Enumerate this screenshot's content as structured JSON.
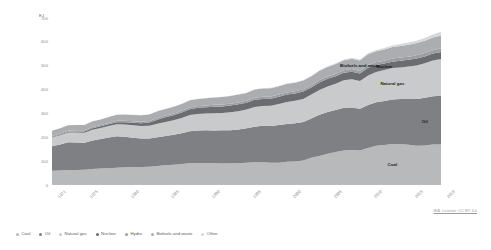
{
  "chart_data": {
    "type": "area",
    "title": "",
    "subtitle": "",
    "xlabel": "",
    "ylabel": "EJ",
    "unit": "EJ",
    "stacked": true,
    "grid": false,
    "legend_position": "bottom",
    "xlim": [
      1971,
      2019
    ],
    "ylim": [
      0,
      700
    ],
    "yticks": [
      0,
      100,
      200,
      300,
      400,
      500,
      600,
      700
    ],
    "ytick_labels": [
      "0",
      "100",
      "200",
      "300",
      "400",
      "500",
      "600",
      "700"
    ],
    "xticks": [
      1971,
      1975,
      1980,
      1985,
      1990,
      1995,
      2000,
      2005,
      2010,
      2015,
      2019
    ],
    "xtick_labels": [
      "1971",
      "1975",
      "1980",
      "1985",
      "1990",
      "1995",
      "2000",
      "2005",
      "2010",
      "2015",
      "2019"
    ],
    "x": [
      1971,
      1972,
      1973,
      1974,
      1975,
      1976,
      1977,
      1978,
      1979,
      1980,
      1981,
      1982,
      1983,
      1984,
      1985,
      1986,
      1987,
      1988,
      1989,
      1990,
      1991,
      1992,
      1993,
      1994,
      1995,
      1996,
      1997,
      1998,
      1999,
      2000,
      2001,
      2002,
      2003,
      2004,
      2005,
      2006,
      2007,
      2008,
      2009,
      2010,
      2011,
      2012,
      2013,
      2014,
      2015,
      2016,
      2017,
      2018,
      2019
    ],
    "series": [
      {
        "name": "Coal",
        "color": "#b8b9bb",
        "values": [
          60,
          61,
          63,
          63,
          64,
          67,
          69,
          70,
          72,
          74,
          74,
          75,
          77,
          80,
          83,
          85,
          88,
          91,
          92,
          92,
          91,
          90,
          91,
          91,
          93,
          95,
          95,
          93,
          93,
          97,
          99,
          103,
          114,
          122,
          131,
          138,
          145,
          147,
          145,
          155,
          165,
          168,
          172,
          172,
          169,
          165,
          166,
          170,
          170
        ]
      },
      {
        "name": "Oil",
        "color": "#7f8083",
        "values": [
          102,
          109,
          116,
          115,
          113,
          120,
          124,
          129,
          132,
          128,
          124,
          120,
          118,
          120,
          122,
          126,
          129,
          134,
          136,
          137,
          137,
          139,
          139,
          142,
          145,
          149,
          153,
          154,
          158,
          159,
          160,
          161,
          165,
          172,
          175,
          176,
          179,
          178,
          175,
          180,
          182,
          184,
          186,
          188,
          192,
          196,
          200,
          202,
          204
        ]
      },
      {
        "name": "Natural gas",
        "color": "#c9cacc",
        "values": [
          37,
          39,
          41,
          42,
          42,
          45,
          46,
          48,
          51,
          52,
          52,
          52,
          53,
          57,
          59,
          60,
          64,
          68,
          70,
          71,
          73,
          73,
          75,
          76,
          78,
          83,
          83,
          85,
          88,
          92,
          94,
          97,
          100,
          104,
          107,
          110,
          115,
          118,
          116,
          124,
          127,
          130,
          132,
          133,
          136,
          140,
          144,
          150,
          154
        ]
      },
      {
        "name": "Nuclear",
        "color": "#6b6c6f",
        "values": [
          2,
          3,
          3,
          4,
          5,
          6,
          7,
          8,
          8,
          9,
          11,
          12,
          14,
          17,
          20,
          21,
          23,
          25,
          26,
          26,
          27,
          27,
          28,
          29,
          29,
          30,
          30,
          30,
          31,
          31,
          31,
          31,
          30,
          32,
          32,
          32,
          32,
          32,
          31,
          32,
          29,
          27,
          27,
          28,
          28,
          29,
          29,
          29,
          30
        ]
      },
      {
        "name": "Hydro",
        "color": "#9d9ea1",
        "values": [
          4,
          4,
          4,
          5,
          5,
          5,
          5,
          5,
          6,
          6,
          6,
          6,
          6,
          7,
          7,
          7,
          7,
          7,
          7,
          7,
          8,
          8,
          8,
          8,
          8,
          9,
          9,
          9,
          9,
          9,
          9,
          9,
          9,
          10,
          10,
          10,
          10,
          11,
          11,
          12,
          12,
          12,
          13,
          13,
          13,
          14,
          14,
          14,
          15
        ]
      },
      {
        "name": "Biofuels and waste",
        "color": "#acadb0",
        "values": [
          22,
          22,
          23,
          23,
          23,
          24,
          24,
          25,
          25,
          26,
          26,
          27,
          27,
          28,
          28,
          29,
          29,
          30,
          30,
          31,
          31,
          32,
          32,
          33,
          33,
          34,
          34,
          35,
          35,
          36,
          36,
          37,
          38,
          39,
          40,
          41,
          42,
          43,
          44,
          45,
          46,
          47,
          48,
          49,
          50,
          51,
          52,
          53,
          54
        ]
      },
      {
        "name": "Other",
        "color": "#d7d8da",
        "values": [
          0,
          0,
          0,
          0,
          0,
          0,
          0,
          0,
          0,
          1,
          1,
          1,
          1,
          1,
          1,
          1,
          1,
          1,
          1,
          1,
          1,
          1,
          1,
          1,
          1,
          1,
          2,
          2,
          2,
          2,
          2,
          2,
          2,
          2,
          3,
          3,
          3,
          4,
          4,
          5,
          5,
          6,
          7,
          8,
          9,
          10,
          11,
          13,
          15
        ]
      }
    ],
    "annotations": [
      {
        "text": "Biofuels and waste",
        "series": "Biofuels and waste"
      },
      {
        "text": "Nuclear",
        "series": "Nuclear"
      },
      {
        "text": "Natural gas",
        "series": "Natural gas"
      },
      {
        "text": "Oil",
        "series": "Oil"
      },
      {
        "text": "Coal",
        "series": "Coal"
      }
    ]
  },
  "legend": {
    "items": [
      {
        "label": "Coal",
        "color": "#b8b9bb"
      },
      {
        "label": "Oil",
        "color": "#7f8083"
      },
      {
        "label": "Natural gas",
        "color": "#c9cacc"
      },
      {
        "label": "Nuclear",
        "color": "#6b6c6f"
      },
      {
        "label": "Hydro",
        "color": "#9d9ea1"
      },
      {
        "label": "Biofuels and waste",
        "color": "#acadb0"
      },
      {
        "label": "Other",
        "color": "#d7d8da"
      }
    ]
  },
  "footer": {
    "license": "IEA. License: CC BY 4.0"
  }
}
